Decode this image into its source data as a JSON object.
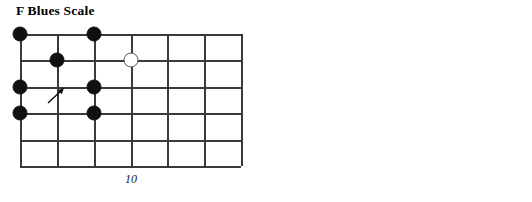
{
  "page": {
    "background": "#ffffff",
    "ink": "#111111",
    "gridline_color": "#3a3a3a",
    "open_note_color": "#ffffff"
  },
  "diagrams": [
    {
      "id": "f-blues-scale",
      "title": "F Blues Scale",
      "fret_marker_label": "10",
      "grid": {
        "strings": 6,
        "frets": 6,
        "vertical_lines": 7,
        "horizontal_lines": 6
      },
      "notes": [
        {
          "string": 5,
          "fret": 0,
          "type": "filled"
        },
        {
          "string": 5,
          "fret": 2,
          "type": "filled"
        },
        {
          "string": 4,
          "fret": 1,
          "type": "filled"
        },
        {
          "string": 4,
          "fret": 3,
          "type": "open"
        },
        {
          "string": 3,
          "fret": 0,
          "type": "filled"
        },
        {
          "string": 3,
          "fret": 2,
          "type": "filled"
        },
        {
          "string": 2,
          "fret": 0,
          "type": "filled"
        },
        {
          "string": 2,
          "fret": 2,
          "type": "filled"
        }
      ],
      "arrow": {
        "string": 3,
        "fret": 1,
        "direction": "up-right"
      }
    },
    {
      "id": "f-major-scale",
      "title": "F Major Scale",
      "fret_marker_label": "10",
      "grid": {
        "strings": 6,
        "frets": 6,
        "vertical_lines": 7,
        "horizontal_lines": 6
      },
      "notes": [
        {
          "string": 5,
          "fret": 1,
          "type": "filled"
        },
        {
          "string": 5,
          "fret": 3,
          "type": "filled"
        },
        {
          "string": 4,
          "fret": 1,
          "type": "filled"
        },
        {
          "string": 4,
          "fret": 3,
          "type": "filled"
        },
        {
          "string": 4,
          "fret": 4,
          "type": "open"
        },
        {
          "string": 3,
          "fret": 0,
          "type": "filled"
        },
        {
          "string": 3,
          "fret": 2,
          "type": "filled"
        },
        {
          "string": 3,
          "fret": 3,
          "type": "filled"
        },
        {
          "string": 3,
          "fret": 5,
          "type": "open"
        },
        {
          "string": 2,
          "fret": 0,
          "type": "filled"
        },
        {
          "string": 2,
          "fret": 1,
          "type": "filled"
        },
        {
          "string": 2,
          "fret": 3,
          "type": "filled"
        },
        {
          "string": 2,
          "fret": 5,
          "type": "open"
        }
      ],
      "arrow": {
        "string": 3,
        "fret": 2,
        "direction": "up-right"
      }
    }
  ]
}
